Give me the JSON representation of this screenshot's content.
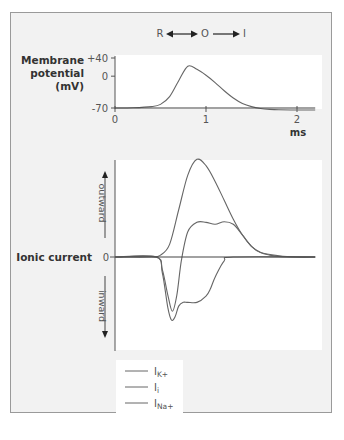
{
  "chart_data": [
    {
      "type": "line",
      "title": "",
      "state_diagram": {
        "states": [
          "R",
          "O",
          "I"
        ],
        "transitions": [
          "R<->O",
          "O->I"
        ]
      },
      "ylabel": [
        "Membrane",
        "potential",
        "(mV)"
      ],
      "xlabel": "ms",
      "ylim": [
        -70,
        40
      ],
      "xlim": [
        0,
        2.2
      ],
      "yticks": [
        {
          "value": 40,
          "label": "+40"
        },
        {
          "value": 0,
          "label": "0"
        },
        {
          "value": -70,
          "label": "-70"
        }
      ],
      "xticks": [
        {
          "value": 0,
          "label": "0"
        },
        {
          "value": 1,
          "label": "1"
        },
        {
          "value": 2,
          "label": "2"
        }
      ],
      "series": [
        {
          "name": "Membrane potential",
          "x": [
            0,
            0.2,
            0.4,
            0.5,
            0.6,
            0.7,
            0.8,
            0.9,
            1.0,
            1.1,
            1.2,
            1.3,
            1.4,
            1.5,
            1.6,
            1.7,
            1.8,
            2.0,
            2.2
          ],
          "y": [
            -70,
            -69.5,
            -67,
            -62,
            -45,
            -10,
            22,
            15,
            2,
            -14,
            -32,
            -48,
            -60,
            -67,
            -71,
            -73,
            -74,
            -74.5,
            -74.5
          ]
        },
        {
          "name": "Resting baseline",
          "x": [
            0,
            2.2
          ],
          "y": [
            -70,
            -70
          ]
        }
      ]
    },
    {
      "type": "line",
      "ylabel": "Ionic current",
      "zero_label": "0",
      "direction_labels": {
        "up": "outward",
        "down": "inward"
      },
      "xlim": [
        0,
        2.2
      ],
      "ylim": [
        -1,
        1.6
      ],
      "series": [
        {
          "name": "IK+",
          "x": [
            0,
            0.4,
            0.5,
            0.6,
            0.7,
            0.8,
            0.9,
            1.0,
            1.1,
            1.2,
            1.3,
            1.4,
            1.5,
            1.6,
            1.7,
            1.8,
            2.0,
            2.2
          ],
          "y": [
            0,
            0,
            0.03,
            0.2,
            0.75,
            1.3,
            1.55,
            1.45,
            1.2,
            0.9,
            0.6,
            0.35,
            0.17,
            0.07,
            0.03,
            0.01,
            0,
            0
          ]
        },
        {
          "name": "Ii",
          "x": [
            0,
            0.45,
            0.52,
            0.58,
            0.63,
            0.68,
            0.73,
            0.8,
            0.9,
            1.0,
            1.1,
            1.2,
            1.3,
            1.4,
            1.5,
            1.6,
            1.8,
            2.0,
            2.2
          ],
          "y": [
            0,
            0,
            -0.2,
            -0.6,
            -0.86,
            -0.6,
            -0.05,
            0.4,
            0.55,
            0.55,
            0.52,
            0.56,
            0.52,
            0.35,
            0.17,
            0.07,
            0.02,
            0,
            0
          ]
        },
        {
          "name": "INa+",
          "x": [
            0,
            0.45,
            0.52,
            0.58,
            0.62,
            0.66,
            0.7,
            0.75,
            0.8,
            0.9,
            1.0,
            1.05,
            1.1,
            1.2,
            1.3,
            2.2
          ],
          "y": [
            0,
            0,
            -0.25,
            -0.8,
            -1.0,
            -0.95,
            -0.78,
            -0.72,
            -0.72,
            -0.72,
            -0.62,
            -0.5,
            -0.32,
            -0.06,
            0,
            0
          ]
        },
        {
          "name": "zero line",
          "x": [
            0,
            2.2
          ],
          "y": [
            0,
            0
          ]
        }
      ],
      "legend": [
        "IK+",
        "Ii",
        "INa+"
      ],
      "legend_position": "bottom-left"
    }
  ],
  "legend_items": [
    {
      "main": "I",
      "sub": "K+"
    },
    {
      "main": "I",
      "sub": "i"
    },
    {
      "main": "I",
      "sub": "Na+"
    }
  ],
  "colors": {
    "frame_bg": "#f2f2f2",
    "plot_bg": "#ffffff",
    "line": "#666666",
    "axis": "#555555"
  }
}
